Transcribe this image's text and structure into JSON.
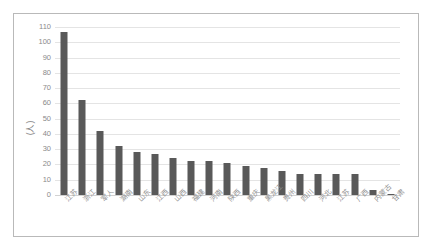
{
  "chart_data": {
    "type": "bar",
    "title": "",
    "xlabel": "",
    "ylabel": "(人)",
    "ylim": [
      0,
      110
    ],
    "ytick_step": 10,
    "yticks": [
      110,
      100,
      90,
      80,
      70,
      60,
      50,
      40,
      30,
      20,
      10,
      0
    ],
    "grid": true,
    "legend": false,
    "bar_color": "#595959",
    "gridline_color": "#e4e4e4",
    "categories": [
      "江苏",
      "浙江",
      "军人",
      "湖南",
      "山东",
      "江西",
      "山西",
      "福建",
      "河南",
      "陕西",
      "重庆",
      "黑龙江",
      "贵州",
      "四川",
      "河北",
      "江苏",
      "广西",
      "内蒙古",
      "甘肃"
    ],
    "values": [
      107,
      62,
      42,
      32,
      28,
      27,
      24,
      22,
      22,
      21,
      19,
      17.5,
      16,
      14,
      14,
      14,
      13.5,
      3,
      0.5
    ]
  },
  "frame": {
    "border_color": "#b9b9b9",
    "background": "#ffffff"
  }
}
